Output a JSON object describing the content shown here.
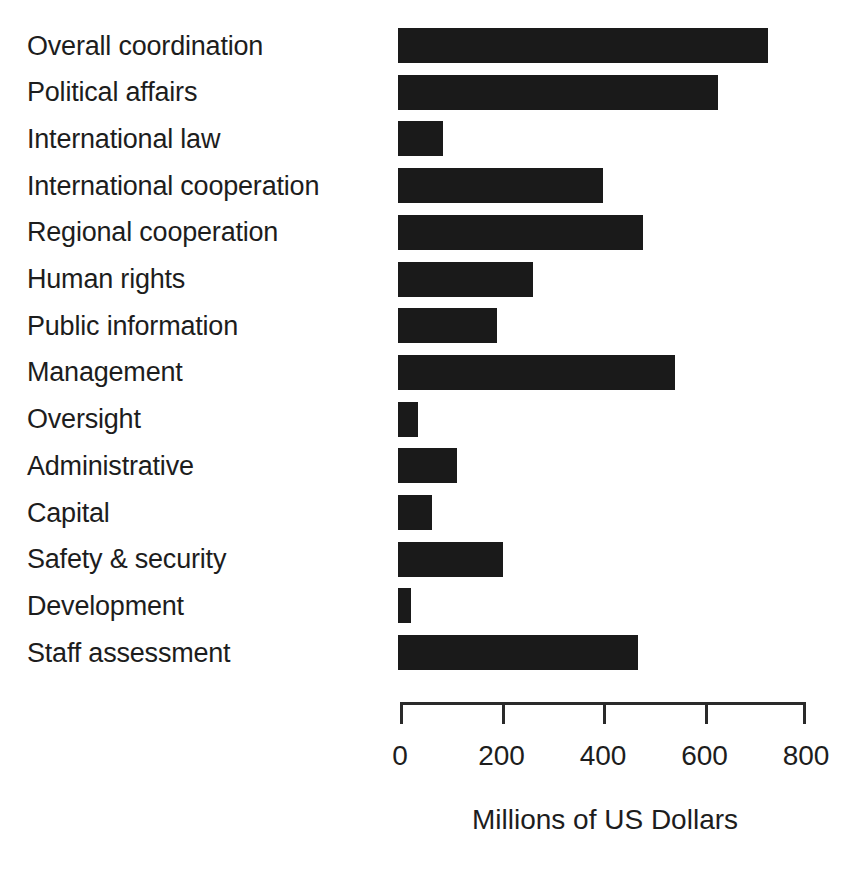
{
  "chart_data": {
    "type": "bar",
    "orientation": "horizontal",
    "title": "",
    "subtitle": "",
    "xlabel": "Millions of US Dollars",
    "ylabel": "",
    "categories": [
      "Overall coordination",
      "Political affairs",
      "International law",
      "International cooperation",
      "Regional cooperation",
      "Human rights",
      "Public information",
      "Management",
      "Oversight",
      "Administrative",
      "Capital",
      "Safety & security",
      "Development",
      "Staff assessment"
    ],
    "values": [
      725,
      627,
      85,
      400,
      479,
      262,
      191,
      542,
      36,
      112,
      64,
      203,
      21,
      469
    ],
    "xlim": [
      0,
      800
    ],
    "xticks": [
      0,
      200,
      400,
      600,
      800
    ],
    "xtick_labels": [
      "0",
      "200",
      "400",
      "600",
      "800"
    ],
    "grid": false,
    "legend": false,
    "bar_color": "#1a1a1a",
    "axis_color": "#2a2a2a",
    "background_color": "#ffffff"
  }
}
